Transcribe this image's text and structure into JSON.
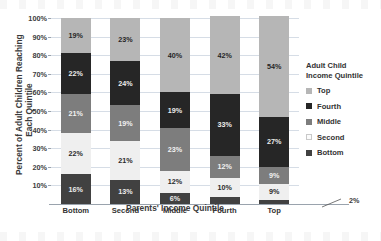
{
  "chart_data": {
    "type": "bar",
    "subtype": "stacked-100-percent-column",
    "title": "",
    "xlabel": "Parents' Income Quintile",
    "ylabel_lines": [
      "Percent of Adult Children Reaching",
      "Each Quintile"
    ],
    "ylabel": "Percent of Adult Children Reaching Each Quintile",
    "categories": [
      "Bottom",
      "Second",
      "Middle",
      "Fourth",
      "Top"
    ],
    "ylim": [
      0,
      100
    ],
    "yticks": [
      "10%",
      "20%",
      "30%",
      "40%",
      "50%",
      "60%",
      "70%",
      "80%",
      "90%",
      "100%"
    ],
    "ytick_values": [
      10,
      20,
      30,
      40,
      50,
      60,
      70,
      80,
      90,
      100
    ],
    "grid": true,
    "legend_position": "right",
    "legend_title_lines": [
      "Adult Child",
      "Income Quintile"
    ],
    "legend_title": "Adult Child Income Quintile",
    "series": [
      {
        "name": "Top",
        "color": "#b6b6b6",
        "values": [
          19,
          23,
          40,
          42,
          54
        ],
        "labels": [
          "19%",
          "23%",
          "40%",
          "42%",
          "54%"
        ]
      },
      {
        "name": "Fourth",
        "color": "#262626",
        "values": [
          22,
          24,
          19,
          33,
          27
        ],
        "labels": [
          "22%",
          "24%",
          "19%",
          "33%",
          "27%"
        ]
      },
      {
        "name": "Middle",
        "color": "#7d7d7d",
        "values": [
          21,
          19,
          23,
          12,
          9
        ],
        "labels": [
          "21%",
          "19%",
          "23%",
          "12%",
          "9%"
        ]
      },
      {
        "name": "Second",
        "color": "#efefef",
        "values": [
          22,
          21,
          12,
          10,
          9
        ],
        "labels": [
          "22%",
          "21%",
          "12%",
          "10%",
          "9%"
        ]
      },
      {
        "name": "Bottom",
        "color": "#414141",
        "values": [
          16,
          13,
          6,
          4,
          2
        ],
        "labels": [
          "16%",
          "13%",
          "6%",
          "4%",
          "2%"
        ]
      }
    ],
    "annotations": [
      {
        "text": "2%",
        "target_category": "Top",
        "target_series": "Bottom",
        "style": "external-callout-with-leader-line"
      }
    ]
  }
}
